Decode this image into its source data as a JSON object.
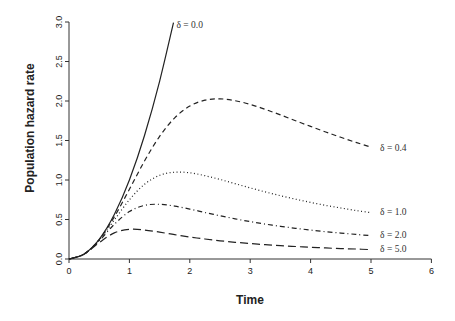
{
  "chart_data": {
    "type": "line",
    "title": "",
    "xlabel": "Time",
    "ylabel": "Population hazard rate",
    "xlim": [
      0,
      6
    ],
    "ylim": [
      0,
      3.0
    ],
    "x_ticks": [
      "0",
      "1",
      "2",
      "3",
      "4",
      "5",
      "6"
    ],
    "y_ticks": [
      "0.0",
      "0.5",
      "1.0",
      "1.5",
      "2.0",
      "2.5",
      "3.0"
    ],
    "grid": false,
    "legend": "inline labels at right end of each curve",
    "series": [
      {
        "name": "δ = 0.0",
        "style": "solid",
        "x": [
          0,
          0.25,
          0.5,
          0.75,
          1.0,
          1.25,
          1.5,
          1.73
        ],
        "values": [
          0,
          0.063,
          0.25,
          0.563,
          1.0,
          1.563,
          2.25,
          2.993
        ],
        "label_at": [
          1.78,
          2.93
        ]
      },
      {
        "name": "δ = 0.4",
        "style": "dashed",
        "x": [
          0,
          0.25,
          0.5,
          0.75,
          1.0,
          1.25,
          1.5,
          1.75,
          2.0,
          2.25,
          2.5,
          2.75,
          3.0,
          3.25,
          3.5,
          3.75,
          4.0,
          4.25,
          4.5,
          4.75,
          5.0
        ],
        "values": [
          0,
          0.062,
          0.246,
          0.533,
          0.882,
          1.24,
          1.552,
          1.787,
          1.935,
          2.01,
          2.027,
          2.004,
          1.957,
          1.894,
          1.824,
          1.751,
          1.678,
          1.608,
          1.54,
          1.476,
          1.415
        ],
        "label_at": [
          5.15,
          1.37
        ]
      },
      {
        "name": "δ = 1.0",
        "style": "dotted",
        "x": [
          0,
          0.25,
          0.5,
          0.75,
          1.0,
          1.25,
          1.5,
          1.75,
          2.0,
          2.25,
          2.5,
          2.75,
          3.0,
          3.25,
          3.5,
          3.75,
          4.0,
          4.25,
          4.5,
          4.75,
          5.0
        ],
        "values": [
          0,
          0.062,
          0.24,
          0.493,
          0.75,
          0.946,
          1.059,
          1.099,
          1.091,
          1.055,
          1.007,
          0.953,
          0.9,
          0.849,
          0.801,
          0.757,
          0.716,
          0.679,
          0.645,
          0.614,
          0.586
        ],
        "label_at": [
          5.15,
          0.56
        ]
      },
      {
        "name": "δ = 2.0",
        "style": "dotdash",
        "x": [
          0,
          0.25,
          0.5,
          0.75,
          1.0,
          1.25,
          1.5,
          1.75,
          2.0,
          2.25,
          2.5,
          2.75,
          3.0,
          3.25,
          3.5,
          3.75,
          4.0,
          4.25,
          4.5,
          4.75,
          5.0
        ],
        "values": [
          0,
          0.062,
          0.231,
          0.439,
          0.6,
          0.679,
          0.692,
          0.67,
          0.632,
          0.589,
          0.547,
          0.509,
          0.474,
          0.442,
          0.414,
          0.389,
          0.366,
          0.346,
          0.328,
          0.311,
          0.296
        ],
        "label_at": [
          5.15,
          0.27
        ]
      },
      {
        "name": "δ = 5.0",
        "style": "longdash",
        "x": [
          0,
          0.25,
          0.5,
          0.75,
          1.0,
          1.25,
          1.5,
          1.75,
          2.0,
          2.25,
          2.5,
          2.75,
          3.0,
          3.25,
          3.5,
          3.75,
          4.0,
          4.25,
          4.5,
          4.75,
          5.0
        ],
        "values": [
          0,
          0.061,
          0.207,
          0.33,
          0.375,
          0.367,
          0.34,
          0.308,
          0.279,
          0.253,
          0.231,
          0.212,
          0.196,
          0.181,
          0.169,
          0.158,
          0.149,
          0.14,
          0.132,
          0.126,
          0.119
        ],
        "label_at": [
          5.15,
          0.09
        ]
      }
    ]
  },
  "colors": {
    "line": "#222222",
    "axis": "#333333",
    "background": "#ffffff"
  }
}
